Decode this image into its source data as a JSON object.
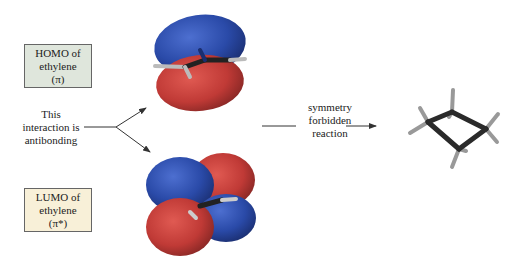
{
  "homo_box": {
    "lines": [
      "HOMO of",
      "ethylene",
      "(π)"
    ],
    "bg_color": "#dfe6dc"
  },
  "lumo_box": {
    "lines": [
      "LUMO of",
      "ethylene",
      "(π*)"
    ],
    "bg_color": "#f8f0d8"
  },
  "interaction_label": {
    "lines": [
      "This",
      "interaction is",
      "antibonding"
    ]
  },
  "reaction_label": {
    "lines": [
      "symmetry",
      "forbidden",
      "reaction"
    ]
  },
  "colors": {
    "lobe_blue": "#2a4aa8",
    "lobe_red": "#c03a36",
    "bond": "#2a2a2a",
    "hydrogen": "#9a9a9a",
    "arrow": "#333333"
  },
  "molecules": {
    "homo_orbital": "ethylene pi bonding orbital (blue top lobe, red bottom lobe)",
    "lumo_orbital": "ethylene pi* antibonding orbital (four alternating lobes)",
    "product": "cyclobutane ball-and-stick model"
  }
}
